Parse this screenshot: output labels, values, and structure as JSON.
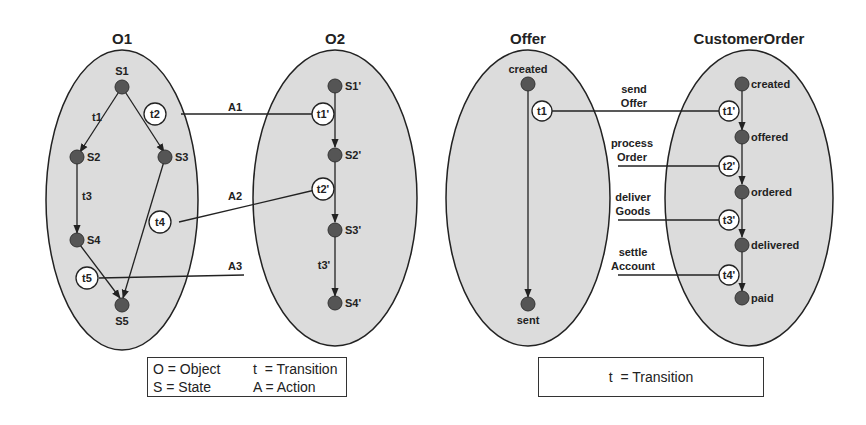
{
  "colors": {
    "ellipse_fill": "#dcdcdc",
    "ellipse_stroke": "#222222",
    "state_fill": "#555555",
    "line": "#222222",
    "background": "#ffffff"
  },
  "left_diagram": {
    "object_o1": {
      "title": "O1",
      "states": [
        "S1",
        "S2",
        "S3",
        "S4",
        "S5"
      ],
      "transitions": [
        "t1",
        "t2",
        "t3",
        "t4",
        "t5"
      ]
    },
    "object_o2": {
      "title": "O2",
      "states": [
        "S1'",
        "S2'",
        "S3'",
        "S4'"
      ],
      "transitions": [
        "t1'",
        "t2'",
        "t3'"
      ]
    },
    "actions": [
      "A1",
      "A2",
      "A3"
    ],
    "legend": {
      "row1_col1": "O = Object",
      "row1_col2": "t  = Transition",
      "row2_col1": "S = State",
      "row2_col2": "A = Action"
    }
  },
  "right_diagram": {
    "offer": {
      "title": "Offer",
      "states": [
        "created",
        "sent"
      ],
      "transitions": [
        "t1"
      ]
    },
    "customer_order": {
      "title": "CustomerOrder",
      "states": [
        "created",
        "offered",
        "ordered",
        "delivered",
        "paid"
      ],
      "transitions": [
        "t1'",
        "t2'",
        "t3'",
        "t4'"
      ]
    },
    "actions": [
      {
        "line1": "send",
        "line2": "Offer"
      },
      {
        "line1": "process",
        "line2": "Order"
      },
      {
        "line1": "deliver",
        "line2": "Goods"
      },
      {
        "line1": "settle",
        "line2": "Account"
      }
    ],
    "legend": {
      "text": "t  = Transition"
    }
  }
}
